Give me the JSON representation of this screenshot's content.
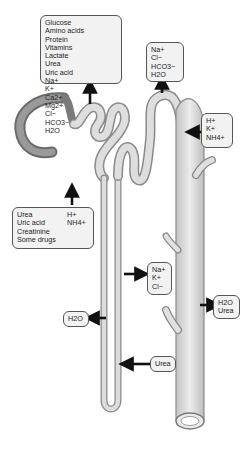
{
  "diagram": {
    "boxes": {
      "pct_reabsorption": {
        "left_column": [
          "Glucose",
          "Amino acids",
          "Protein",
          "Vitamins",
          "Lactate",
          "Urea",
          "Uric acid"
        ],
        "right_column": [
          "Na+",
          "K+",
          "Ca2+",
          "Mg2+",
          "Cl−",
          "HCO3−",
          "H2O"
        ]
      },
      "dct_reabsorption": {
        "items": [
          "Na+",
          "Cl−",
          "HCO3−",
          "H2O"
        ]
      },
      "dct_secretion": {
        "items": [
          "H+",
          "K+",
          "NH4+"
        ]
      },
      "pct_secretion": {
        "left_column": [
          "Urea",
          "Uric acid",
          "Creatinine",
          "Some drugs"
        ],
        "right_column": [
          "H+",
          "NH4+"
        ]
      },
      "ascending_limb_reabsorption": {
        "items": [
          "Na+",
          "K+",
          "Cl−"
        ]
      },
      "collecting_duct_reabsorption": {
        "items": [
          "H2O",
          "Urea"
        ]
      },
      "descending_limb_reabsorption": {
        "items": [
          "H2O"
        ]
      },
      "loop_secretion": {
        "items": [
          "Urea"
        ]
      }
    },
    "colors": {
      "tubule_fill": "#d8d8d8",
      "tubule_stroke": "#8a8a8a",
      "capsule_fill": "#8c8c8c",
      "box_fill": "#f2f2f2",
      "arrow": "#111111"
    }
  }
}
